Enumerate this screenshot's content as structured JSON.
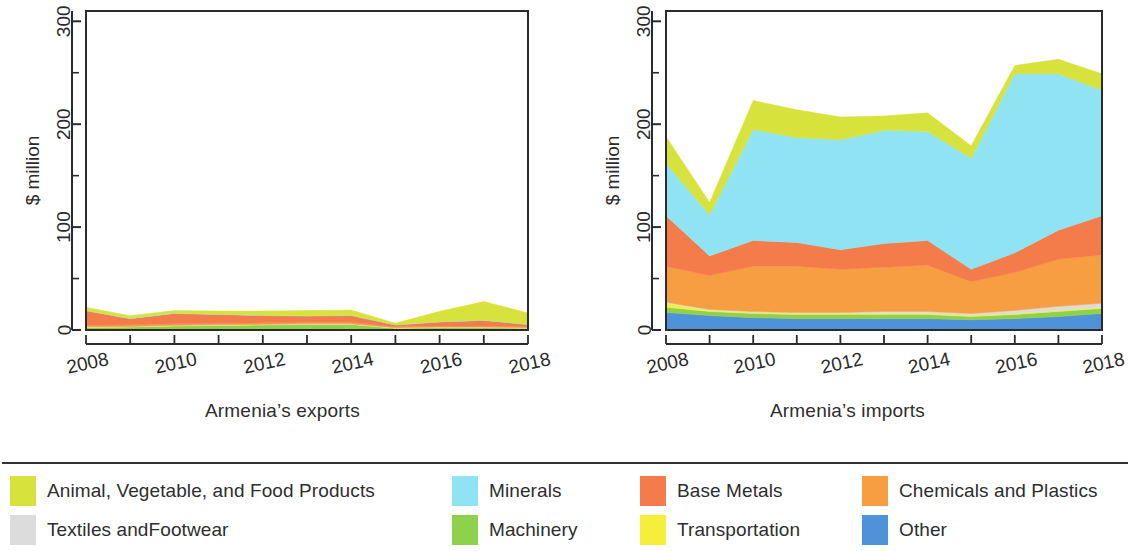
{
  "figure": {
    "y_axis_label": "$ million",
    "y_ticks": [
      0,
      100,
      200,
      300
    ],
    "y_minor_ticks": [
      50,
      150,
      250
    ],
    "x_ticks": [
      2008,
      2009,
      2010,
      2011,
      2012,
      2013,
      2014,
      2015,
      2016,
      2017,
      2018
    ],
    "x_tick_labels": [
      "2008",
      "",
      "2010",
      "",
      "2012",
      "",
      "2014",
      "",
      "2016",
      "",
      "2018"
    ],
    "panels": [
      {
        "id": "exports",
        "caption": "Armenia’s exports"
      },
      {
        "id": "imports",
        "caption": "Armenia’s imports"
      }
    ]
  },
  "legend": {
    "rows": [
      [
        {
          "label": "Animal, Vegetable, and Food Products",
          "color": "#d8e23c",
          "col": "col0"
        },
        {
          "label": "Minerals",
          "color": "#8fe3f2",
          "col": "col1"
        },
        {
          "label": "Base Metals",
          "color": "#f47b4a",
          "col": "col2"
        },
        {
          "label": "Chemicals and Plastics",
          "color": "#f79e42",
          "col": "col3"
        }
      ],
      [
        {
          "label": "Textiles andFootwear",
          "color": "#dcdcdc",
          "col": "col0"
        },
        {
          "label": "Machinery",
          "color": "#8ed14a",
          "col": "col1"
        },
        {
          "label": "Transportation",
          "color": "#f7ee3c",
          "col": "col2"
        },
        {
          "label": "Other",
          "color": "#4e93d9",
          "col": "col3"
        }
      ]
    ]
  },
  "colors": {
    "animal_vegetable_food": "#d8e23c",
    "minerals": "#8fe3f2",
    "base_metals": "#f47b4a",
    "chemicals_plastics": "#f79e42",
    "textiles_footwear": "#dcdcdc",
    "machinery": "#8ed14a",
    "transportation": "#f7ee3c",
    "other": "#4e93d9",
    "axis": "#2b2b2b",
    "background": "#ffffff"
  },
  "chart_data": [
    {
      "type": "area",
      "id": "exports",
      "title": "Armenia’s exports",
      "xlabel": "",
      "ylabel": "$ million",
      "x": [
        2008,
        2009,
        2010,
        2011,
        2012,
        2013,
        2014,
        2015,
        2016,
        2017,
        2018
      ],
      "xlim": [
        2008,
        2018
      ],
      "ylim": [
        0,
        310
      ],
      "stacked": true,
      "stack_order_bottom_to_top": [
        "Other",
        "Machinery",
        "Transportation",
        "Textiles andFootwear",
        "Chemicals and Plastics",
        "Base Metals",
        "Minerals",
        "Animal, Vegetable, and Food Products"
      ],
      "series": [
        {
          "name": "Other",
          "color": "#4e93d9",
          "values": [
            0.5,
            0.4,
            0.4,
            0.4,
            0.4,
            0.4,
            0.4,
            0.3,
            0.3,
            0.3,
            0.3
          ]
        },
        {
          "name": "Machinery",
          "color": "#8ed14a",
          "values": [
            2.0,
            2.5,
            3.5,
            4.0,
            4.5,
            5.0,
            5.0,
            1.5,
            2.0,
            2.0,
            1.5
          ]
        },
        {
          "name": "Transportation",
          "color": "#f7ee3c",
          "values": [
            0.3,
            0.3,
            0.3,
            0.3,
            0.3,
            0.3,
            0.3,
            0.2,
            0.2,
            0.2,
            0.2
          ]
        },
        {
          "name": "Textiles andFootwear",
          "color": "#dcdcdc",
          "values": [
            0.3,
            0.3,
            0.3,
            0.3,
            0.3,
            0.3,
            0.3,
            0.3,
            0.3,
            0.3,
            0.3
          ]
        },
        {
          "name": "Chemicals and Plastics",
          "color": "#f79e42",
          "values": [
            1.5,
            1.5,
            1.5,
            1.5,
            1.5,
            1.5,
            1.5,
            1.0,
            1.0,
            1.0,
            1.0
          ]
        },
        {
          "name": "Base Metals",
          "color": "#f47b4a",
          "values": [
            14.0,
            6.0,
            10.0,
            8.5,
            7.0,
            6.0,
            6.5,
            1.5,
            4.0,
            5.5,
            2.0
          ]
        },
        {
          "name": "Minerals",
          "color": "#8fe3f2",
          "values": [
            0.4,
            0.4,
            0.4,
            0.4,
            0.4,
            0.4,
            0.4,
            0.3,
            0.3,
            0.3,
            0.3
          ]
        },
        {
          "name": "Animal, Vegetable, and Food Products",
          "color": "#d8e23c",
          "values": [
            3.0,
            2.5,
            2.5,
            3.0,
            4.0,
            5.0,
            5.0,
            1.5,
            10.0,
            18.0,
            11.0
          ]
        }
      ],
      "totals": [
        22,
        14,
        19,
        18,
        18,
        19,
        19,
        6.6,
        18,
        27.6,
        16.6
      ]
    },
    {
      "type": "area",
      "id": "imports",
      "title": "Armenia’s imports",
      "xlabel": "",
      "ylabel": "$ million",
      "x": [
        2008,
        2009,
        2010,
        2011,
        2012,
        2013,
        2014,
        2015,
        2016,
        2017,
        2018
      ],
      "xlim": [
        2008,
        2018
      ],
      "ylim": [
        0,
        310
      ],
      "stacked": true,
      "stack_order_bottom_to_top": [
        "Other",
        "Machinery",
        "Transportation",
        "Textiles andFootwear",
        "Chemicals and Plastics",
        "Base Metals",
        "Minerals",
        "Animal, Vegetable, and Food Products"
      ],
      "series": [
        {
          "name": "Other",
          "color": "#4e93d9",
          "values": [
            17,
            14,
            12,
            11,
            11,
            11,
            11,
            10,
            11,
            13,
            16
          ]
        },
        {
          "name": "Machinery",
          "color": "#8ed14a",
          "values": [
            5,
            4,
            4,
            4,
            4,
            4,
            4,
            3,
            4,
            5,
            5
          ]
        },
        {
          "name": "Transportation",
          "color": "#f7ee3c",
          "values": [
            4,
            1,
            1,
            1,
            1,
            1,
            1,
            1,
            1,
            1,
            1
          ]
        },
        {
          "name": "Textiles andFootwear",
          "color": "#dcdcdc",
          "values": [
            1,
            1,
            1,
            1,
            1,
            2,
            2,
            2,
            3,
            4,
            4
          ]
        },
        {
          "name": "Chemicals and Plastics",
          "color": "#f79e42",
          "values": [
            35,
            33,
            44,
            45,
            42,
            43,
            45,
            31,
            37,
            46,
            47
          ]
        },
        {
          "name": "Base Metals",
          "color": "#f47b4a",
          "values": [
            49,
            19,
            25,
            23,
            19,
            23,
            24,
            12,
            19,
            28,
            38
          ]
        },
        {
          "name": "Minerals",
          "color": "#8fe3f2",
          "values": [
            51,
            40,
            108,
            102,
            107,
            110,
            106,
            108,
            174,
            152,
            122
          ]
        },
        {
          "name": "Animal, Vegetable, and Food Products",
          "color": "#d8e23c",
          "values": [
            26,
            12,
            28,
            27,
            22,
            14,
            18,
            12,
            8,
            14,
            16
          ]
        }
      ],
      "totals": [
        188,
        124,
        223,
        214,
        207,
        208,
        211,
        179,
        257,
        263,
        249
      ]
    }
  ]
}
